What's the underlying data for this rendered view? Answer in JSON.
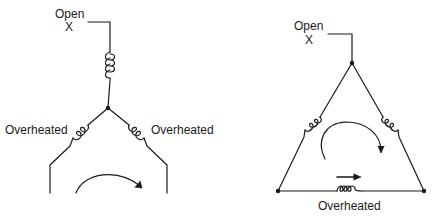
{
  "wye": {
    "open_label": "Open",
    "open_mark": "X",
    "left_winding_label": "Overheated",
    "right_winding_label": "Overheated"
  },
  "delta": {
    "open_label": "Open",
    "open_mark": "X",
    "bottom_winding_label": "Overheated"
  },
  "colors": {
    "line": "#1a1a1a",
    "background": "#ffffff"
  }
}
